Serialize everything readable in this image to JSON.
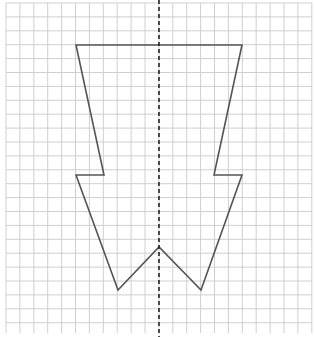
{
  "diagram": {
    "type": "grid-symmetry-figure",
    "grid": {
      "x0": 6,
      "y0": 3,
      "x1": 312,
      "y1": 333,
      "cell": 13.9,
      "line_color": "#cfcfcf"
    },
    "shape": {
      "stroke": "#555555",
      "stroke_width": 1.6,
      "points": [
        [
          76,
          45
        ],
        [
          242,
          45
        ],
        [
          214,
          175
        ],
        [
          242,
          175
        ],
        [
          201,
          290
        ],
        [
          159,
          247
        ],
        [
          118,
          290
        ],
        [
          76,
          175
        ],
        [
          104,
          175
        ]
      ]
    },
    "symmetry_line": {
      "x": 159,
      "y_start": 0,
      "y_end": 337,
      "color": "#222222",
      "dash": "4,3"
    }
  }
}
